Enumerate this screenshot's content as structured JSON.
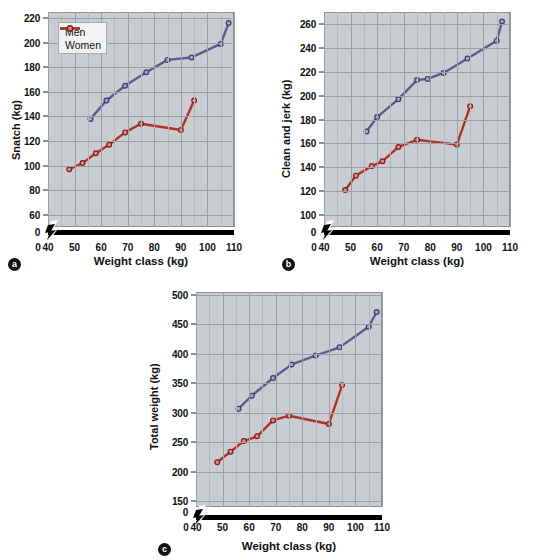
{
  "figure": {
    "series_colors": {
      "men": "#5b5b8e",
      "women": "#b03329"
    },
    "legend": {
      "men_label": "Men",
      "women_label": "Women"
    },
    "xlabel": "Weight class (kg)",
    "xticks": [
      "0",
      "40",
      "50",
      "60",
      "70",
      "80",
      "90",
      "100",
      "110"
    ],
    "panel_a_tag": "a",
    "panel_b_tag": "b",
    "panel_c_tag": "c"
  },
  "chart_data": [
    {
      "type": "line",
      "panel": "a",
      "title": "",
      "xlabel": "Weight class (kg)",
      "ylabel": "Snatch (kg)",
      "xlim": [
        40,
        110
      ],
      "ylim": [
        50,
        225
      ],
      "xticks": [
        40,
        50,
        60,
        70,
        80,
        90,
        100,
        110
      ],
      "yticks": [
        60,
        80,
        100,
        120,
        140,
        160,
        180,
        200,
        220
      ],
      "ytick_labels": [
        "60",
        "80",
        "100",
        "120",
        "140",
        "160",
        "180",
        "200",
        "220"
      ],
      "grid": true,
      "legend_position": "upper left",
      "axis_break_x": true,
      "series": [
        {
          "name": "Men",
          "color": "#5b5b8e",
          "x": [
            56,
            62,
            69,
            77,
            85,
            94,
            105,
            108
          ],
          "values": [
            138,
            153,
            165,
            176,
            186,
            188,
            199,
            216
          ]
        },
        {
          "name": "Women",
          "color": "#b03329",
          "x": [
            48,
            53,
            58,
            63,
            69,
            75,
            90,
            95
          ],
          "values": [
            97,
            102,
            110,
            117,
            127,
            134,
            129,
            153
          ]
        }
      ]
    },
    {
      "type": "line",
      "panel": "b",
      "title": "",
      "xlabel": "Weight class (kg)",
      "ylabel": "Clean and jerk (kg)",
      "xlim": [
        40,
        110
      ],
      "ylim": [
        90,
        270
      ],
      "xticks": [
        40,
        50,
        60,
        70,
        80,
        90,
        100,
        110
      ],
      "yticks": [
        100,
        120,
        140,
        160,
        180,
        200,
        220,
        240,
        260
      ],
      "ytick_labels": [
        "100",
        "120",
        "140",
        "160",
        "180",
        "200",
        "220",
        "240",
        "260"
      ],
      "grid": true,
      "legend_position": "none",
      "axis_break_x": true,
      "series": [
        {
          "name": "Men",
          "color": "#5b5b8e",
          "x": [
            56,
            60,
            68,
            75,
            79,
            85,
            94,
            105,
            107
          ],
          "values": [
            170,
            182,
            197,
            213,
            214,
            219,
            231,
            246,
            262
          ]
        },
        {
          "name": "Women",
          "color": "#b03329",
          "x": [
            48,
            52,
            58,
            62,
            68,
            75,
            90,
            95
          ],
          "values": [
            121,
            133,
            141,
            145,
            157,
            163,
            159,
            191
          ]
        }
      ]
    },
    {
      "type": "line",
      "panel": "c",
      "title": "",
      "xlabel": "Weight class (kg)",
      "ylabel": "Total weight (kg)",
      "xlim": [
        40,
        110
      ],
      "ylim": [
        140,
        505
      ],
      "xticks": [
        40,
        50,
        60,
        70,
        80,
        90,
        100,
        110
      ],
      "yticks": [
        150,
        200,
        250,
        300,
        350,
        400,
        450,
        500
      ],
      "ytick_labels": [
        "150",
        "200",
        "250",
        "300",
        "350",
        "400",
        "450",
        "500"
      ],
      "grid": true,
      "legend_position": "none",
      "axis_break_x": true,
      "series": [
        {
          "name": "Men",
          "color": "#5b5b8e",
          "x": [
            56,
            61,
            69,
            76,
            85,
            94,
            105,
            108
          ],
          "values": [
            307,
            329,
            359,
            382,
            397,
            411,
            446,
            471
          ]
        },
        {
          "name": "Women",
          "color": "#b03329",
          "x": [
            48,
            53,
            58,
            63,
            69,
            75,
            90,
            95
          ],
          "values": [
            216,
            234,
            252,
            260,
            287,
            295,
            281,
            347
          ]
        }
      ]
    }
  ]
}
